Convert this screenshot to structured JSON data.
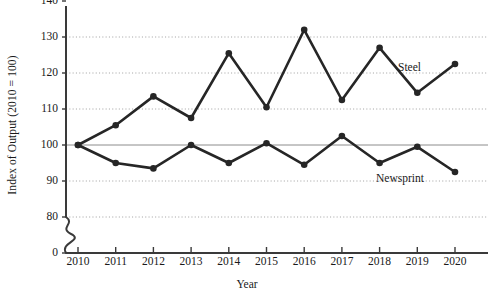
{
  "chart_data": {
    "type": "line",
    "title": "",
    "xlabel": "Year",
    "ylabel": "Index of Output (2010 = 100)",
    "categories": [
      "2010",
      "2011",
      "2012",
      "2013",
      "2014",
      "2015",
      "2016",
      "2017",
      "2018",
      "2019",
      "2020"
    ],
    "x": [
      2010,
      2011,
      2012,
      2013,
      2014,
      2015,
      2016,
      2017,
      2018,
      2019,
      2020
    ],
    "xlim": [
      2010,
      2020
    ],
    "ylim": [
      80,
      140
    ],
    "y_axis_break": true,
    "y_break_from": 0,
    "y_break_to": 80,
    "yticks": [
      "0",
      "80",
      "90",
      "100",
      "110",
      "120",
      "130",
      "140"
    ],
    "ytick_values": [
      0,
      80,
      90,
      100,
      110,
      120,
      130,
      140
    ],
    "gridlines": [
      80,
      90,
      110,
      120,
      130
    ],
    "reference_line": 100,
    "grid": true,
    "legend_position": "inline-labels",
    "series": [
      {
        "name": "Steel",
        "color": "#262626",
        "label_x": 398,
        "label_y": 61,
        "values": [
          100,
          105.5,
          113.5,
          107.5,
          125.5,
          110.5,
          132,
          112.5,
          127,
          114.5,
          122.5
        ]
      },
      {
        "name": "Newsprint",
        "color": "#262626",
        "label_x": 376,
        "label_y": 172,
        "values": [
          100,
          95,
          93.5,
          100,
          95,
          100.5,
          94.5,
          102.5,
          95,
          99.5,
          92.5
        ]
      }
    ]
  },
  "axes": {
    "y_axis_label": "Index of Output (2010 = 100)",
    "x_axis_label": "Year"
  },
  "colors": {
    "line": "#262626",
    "axis": "#3a3a3a",
    "grid": "#a8a8a8",
    "reference": "#8c8c8c",
    "background": "#ffffff"
  }
}
